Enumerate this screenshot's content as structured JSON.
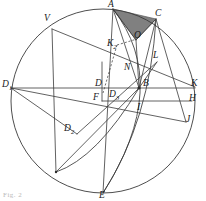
{
  "figure": {
    "kind": "geometric-construction-diagram",
    "width": 206,
    "height": 201,
    "background_color": "#ffffff",
    "stroke_color": "#3a3a3a",
    "shaded_region_fill": "#808080",
    "shaded_region_name": "triangle-A-C-O",
    "caption_fragment": "Fig. 2",
    "circle": {
      "name": "main-circle",
      "cx": 103,
      "cy": 101,
      "r": 92
    },
    "points": [
      {
        "id": "A",
        "label": "A",
        "sub": "",
        "x": 113,
        "y": 9,
        "lx": 108,
        "ly": 0
      },
      {
        "id": "C",
        "label": "C",
        "sub": "",
        "x": 156,
        "y": 19,
        "lx": 155,
        "ly": 9
      },
      {
        "id": "O",
        "label": "O",
        "sub": "",
        "x": 136,
        "y": 40,
        "lx": 134,
        "ly": 31
      },
      {
        "id": "K2",
        "label": "K",
        "sub": "2",
        "x": 118,
        "y": 47,
        "lx": 107,
        "ly": 39
      },
      {
        "id": "L",
        "label": "L",
        "sub": "",
        "x": 155,
        "y": 62,
        "lx": 153,
        "ly": 51
      },
      {
        "id": "N",
        "label": "N",
        "sub": "",
        "x": 128,
        "y": 72,
        "lx": 124,
        "ly": 63
      },
      {
        "id": "V",
        "label": "V",
        "sub": "",
        "x": 52,
        "y": 29,
        "lx": 46,
        "ly": 14
      },
      {
        "id": "D1",
        "label": "D",
        "sub": "1",
        "x": 13,
        "y": 88,
        "lx": 3,
        "ly": 80
      },
      {
        "id": "D",
        "label": "D",
        "sub": "",
        "x": 102,
        "y": 88,
        "lx": 96,
        "ly": 79
      },
      {
        "id": "B",
        "label": "B",
        "sub": "",
        "x": 139,
        "y": 88,
        "lx": 143,
        "ly": 79
      },
      {
        "id": "K",
        "label": "K",
        "sub": "",
        "x": 193,
        "y": 88,
        "lx": 192,
        "ly": 79
      },
      {
        "id": "D3",
        "label": "D",
        "sub": "3",
        "x": 112,
        "y": 98,
        "lx": 108,
        "ly": 90
      },
      {
        "id": "F",
        "label": "F",
        "sub": "",
        "x": 102,
        "y": 101,
        "lx": 94,
        "ly": 93
      },
      {
        "id": "I",
        "label": "I",
        "sub": "",
        "x": 139,
        "y": 101,
        "lx": 138,
        "ly": 103
      },
      {
        "id": "H",
        "label": "H",
        "sub": "",
        "x": 190,
        "y": 101,
        "lx": 190,
        "ly": 94
      },
      {
        "id": "J",
        "label": "J",
        "sub": "",
        "x": 186,
        "y": 122,
        "lx": 186,
        "ly": 116
      },
      {
        "id": "D2",
        "label": "D",
        "sub": "2",
        "x": 77,
        "y": 134,
        "lx": 66,
        "ly": 124
      },
      {
        "id": "E",
        "label": "E",
        "sub": "",
        "x": 103,
        "y": 193,
        "lx": 100,
        "ly": 192
      }
    ],
    "segments": [
      {
        "name": "segment-A-E",
        "x1": 113,
        "y1": 9,
        "x2": 103,
        "y2": 193
      },
      {
        "name": "segment-A-O",
        "x1": 113,
        "y1": 9,
        "x2": 136,
        "y2": 40
      },
      {
        "name": "segment-A-B",
        "x1": 113,
        "y1": 9,
        "x2": 139,
        "y2": 88
      },
      {
        "name": "segment-C-O",
        "x1": 156,
        "y1": 19,
        "x2": 136,
        "y2": 40
      },
      {
        "name": "segment-C-B",
        "x1": 156,
        "y1": 19,
        "x2": 139,
        "y2": 88
      },
      {
        "name": "segment-C-J",
        "x1": 156,
        "y1": 19,
        "x2": 186,
        "y2": 122
      },
      {
        "name": "segment-O-B",
        "x1": 136,
        "y1": 40,
        "x2": 139,
        "y2": 88
      },
      {
        "name": "segment-D1-K",
        "x1": 11,
        "y1": 88,
        "x2": 195,
        "y2": 88
      },
      {
        "name": "segment-F-H",
        "x1": 102,
        "y1": 101,
        "x2": 192,
        "y2": 101
      },
      {
        "name": "segment-V-K",
        "x1": 52,
        "y1": 29,
        "x2": 195,
        "y2": 87
      },
      {
        "name": "segment-V-SW",
        "x1": 52,
        "y1": 29,
        "x2": 56,
        "y2": 172
      },
      {
        "name": "segment-D1-J",
        "x1": 11,
        "y1": 88,
        "x2": 186,
        "y2": 122
      },
      {
        "name": "segment-D1-D2",
        "x1": 11,
        "y1": 88,
        "x2": 77,
        "y2": 134
      },
      {
        "name": "segment-D2-L",
        "x1": 77,
        "y1": 134,
        "x2": 157,
        "y2": 62
      },
      {
        "name": "segment-B-L",
        "x1": 139,
        "y1": 88,
        "x2": 157,
        "y2": 62
      },
      {
        "name": "segment-SW-B",
        "x1": 56,
        "y1": 172,
        "x2": 139,
        "y2": 88
      },
      {
        "name": "segment-F-vert",
        "x1": 102,
        "y1": 62,
        "x2": 102,
        "y2": 101
      }
    ],
    "dashed_segments": [
      {
        "name": "dashed-K2-O",
        "x1": 117,
        "y1": 45,
        "x2": 137,
        "y2": 39
      },
      {
        "name": "dashed-K2-D",
        "x1": 117,
        "y1": 45,
        "x2": 103,
        "y2": 93
      }
    ],
    "arcs": [
      {
        "name": "arc-A-E-through-B",
        "d": "M 113 9 Q 172 85 103 193"
      },
      {
        "name": "arc-C-E",
        "d": "M 156 19 Q 150 120 103 193"
      },
      {
        "name": "arc-B-SW",
        "d": "M 139 88 Q 97 158 56 172"
      }
    ]
  }
}
